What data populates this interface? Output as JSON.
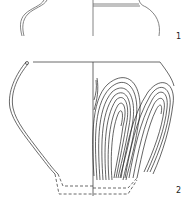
{
  "figure": {
    "items": [
      {
        "label": "1",
        "name": "vessel-1"
      },
      {
        "label": "2",
        "name": "vessel-2"
      }
    ],
    "colors": {
      "line": "#444444",
      "background": "#ffffff"
    }
  }
}
